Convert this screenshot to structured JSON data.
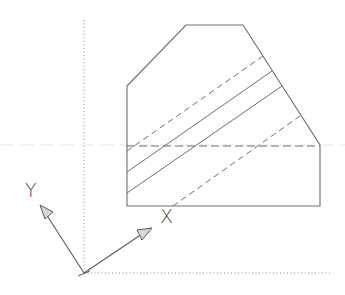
{
  "diagram": {
    "colors": {
      "line": "#6e6e6e",
      "dotted": "#8a8a8a",
      "arrow_fill": "#d8d8d8",
      "text": "#4a4a4a",
      "background": "#ffffff"
    },
    "labels": {
      "y_axis": "Y",
      "x_axis": "X"
    },
    "shape": {
      "outline_points": "127,86 186,25 243,25 320,145 320,206 127,206",
      "hidden_horizontal": {
        "x1": 127,
        "y1": 146,
        "x2": 320,
        "y2": 146
      },
      "diagonals": [
        {
          "type": "dashed",
          "x1": 127,
          "y1": 151,
          "x2": 263,
          "y2": 56
        },
        {
          "type": "solid",
          "x1": 127,
          "y1": 172,
          "x2": 272,
          "y2": 71
        },
        {
          "type": "solid",
          "x1": 127,
          "y1": 193,
          "x2": 282,
          "y2": 86
        },
        {
          "type": "dashed",
          "x1": 173,
          "y1": 206,
          "x2": 300,
          "y2": 116
        }
      ]
    },
    "axes": {
      "origin": {
        "x": 84,
        "y": 273
      },
      "world_vertical_dotted": {
        "x1": 84,
        "y1": 20,
        "x2": 84,
        "y2": 276
      },
      "world_horizontal_dotted": {
        "x1": 84,
        "y1": 273,
        "x2": 330,
        "y2": 273
      },
      "ucs_y_arrow": {
        "x1": 84,
        "y1": 273,
        "x2": 40,
        "y2": 205
      },
      "ucs_x_arrow": {
        "x1": 84,
        "y1": 273,
        "x2": 152,
        "y2": 228
      }
    }
  }
}
